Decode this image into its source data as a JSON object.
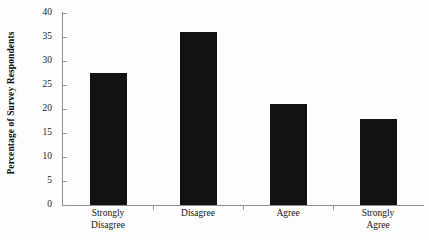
{
  "chart_data": {
    "type": "bar",
    "title": "",
    "subtitle": "",
    "xlabel": "",
    "ylabel": "Percentage of Survey Respondents",
    "categories": [
      "Strongly Disagree",
      "Disagree",
      "Agree",
      "Strongly Agree"
    ],
    "category_lines": [
      [
        "Strongly",
        "Disagree"
      ],
      [
        "Disagree"
      ],
      [
        "Agree"
      ],
      [
        "Strongly",
        "Agree"
      ]
    ],
    "values": [
      27.5,
      36,
      21,
      18
    ],
    "ylim": [
      0,
      40
    ],
    "ytick_step": 5,
    "ytick_labels": [
      "40",
      "35",
      "30",
      "25",
      "20",
      "15",
      "10",
      "5",
      "0"
    ],
    "ytick_values": [
      40,
      35,
      30,
      25,
      20,
      15,
      10,
      5,
      0
    ],
    "grid": false,
    "legend": false,
    "legend_position": "none",
    "bar_color": "#121212",
    "axis_color": "#8d8d8d"
  },
  "axis": {
    "y_title": "Percentage of Survey Respondents"
  }
}
